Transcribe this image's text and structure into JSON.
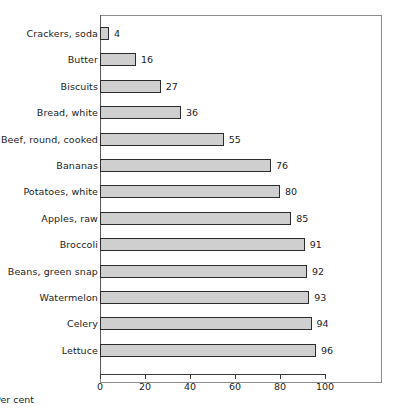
{
  "chart_data": {
    "type": "bar",
    "orientation": "horizontal",
    "title": "",
    "xlabel": "Per cent",
    "ylabel": "",
    "xlim": [
      0,
      100
    ],
    "xticks": [
      0,
      20,
      40,
      60,
      80,
      100
    ],
    "xtick_labels": [
      "0",
      "20",
      "40",
      "60",
      "80",
      "100"
    ],
    "grid": false,
    "legend": null,
    "categories": [
      "Crackers, soda",
      "Butter",
      "Biscuits",
      "Bread, white",
      "Beef, round, cooked",
      "Bananas",
      "Potatoes, white",
      "Apples, raw",
      "Broccoli",
      "Beans, green snap",
      "Watermelon",
      "Celery",
      "Lettuce"
    ],
    "values": [
      4,
      16,
      27,
      36,
      55,
      76,
      80,
      85,
      91,
      92,
      93,
      94,
      96
    ],
    "data_labels": [
      "4",
      "16",
      "27",
      "36",
      "55",
      "76",
      "80",
      "85",
      "91",
      "92",
      "93",
      "94",
      "96"
    ],
    "bar_fill_color": "#cfcfcf",
    "bar_border_color": "#2c2c2c",
    "axis_color": "#3a3a3a",
    "frame_color": "#8d8d8d",
    "background_color": "#ffffff"
  }
}
